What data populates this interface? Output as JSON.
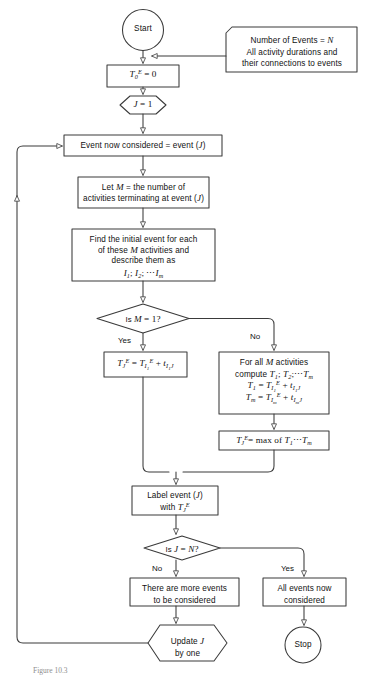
{
  "figure": {
    "caption": "Figure 10.3",
    "background_color": "#ffffff",
    "line_color": "#3a3a3a",
    "text_color": "#111111"
  },
  "nodes": {
    "start": {
      "label": "Start",
      "shape": "circle"
    },
    "input_annotation": {
      "shape": "input-data",
      "lines": [
        "Number of Events = N",
        "All activity durations and",
        "their connections to events"
      ]
    },
    "init_t0": {
      "shape": "process",
      "label": "T0E = 0",
      "text": "T",
      "sub": "0",
      "sup": "E",
      "rhs": "= 0"
    },
    "init_j": {
      "shape": "hexagon",
      "label": "J = 1"
    },
    "event_considered": {
      "shape": "process",
      "label": "Event now considered = event (J)"
    },
    "let_m": {
      "shape": "process",
      "lines": [
        "Let M = the number of",
        "activities terminating at event (J)"
      ]
    },
    "find_initial": {
      "shape": "process",
      "lines": [
        "Find the initial event for each",
        "of these M activities and",
        "describe them as",
        "I1; I2; ... Im"
      ]
    },
    "decision_m": {
      "shape": "diamond",
      "label": "Is M = 1?",
      "yes": "Yes",
      "no": "No"
    },
    "single_formula": {
      "shape": "process",
      "label": "TJE = TI1E + tI1J"
    },
    "multi_compute": {
      "shape": "process",
      "lines": [
        "For all M activities",
        "compute T1; T2; ... Tm",
        "T1 = TI1E + tI1J",
        "Tm = TImE + tImJ"
      ]
    },
    "max_formula": {
      "shape": "process",
      "label": "TJE = max of T1 ... Tm"
    },
    "label_event": {
      "shape": "process",
      "lines": [
        "Label event (J)",
        "with TJE"
      ]
    },
    "decision_j": {
      "shape": "diamond",
      "label": "Is J = N?",
      "yes": "Yes",
      "no": "No"
    },
    "more_events": {
      "shape": "process",
      "lines": [
        "There are more events",
        "to be considered"
      ]
    },
    "all_done": {
      "shape": "process",
      "lines": [
        "All events now",
        "considered"
      ]
    },
    "update_j": {
      "shape": "hexagon",
      "lines": [
        "Update J",
        "by one"
      ]
    },
    "stop": {
      "label": "Stop",
      "shape": "circle"
    }
  },
  "edges": [
    {
      "from": "start",
      "to": "init_t0",
      "label": ""
    },
    {
      "from": "input_annotation",
      "to": "init_t0",
      "label": ""
    },
    {
      "from": "init_t0",
      "to": "init_j",
      "label": ""
    },
    {
      "from": "init_j",
      "to": "event_considered",
      "label": ""
    },
    {
      "from": "event_considered",
      "to": "let_m",
      "label": ""
    },
    {
      "from": "let_m",
      "to": "find_initial",
      "label": ""
    },
    {
      "from": "find_initial",
      "to": "decision_m",
      "label": ""
    },
    {
      "from": "decision_m",
      "to": "single_formula",
      "label": "Yes"
    },
    {
      "from": "decision_m",
      "to": "multi_compute",
      "label": "No"
    },
    {
      "from": "multi_compute",
      "to": "max_formula",
      "label": ""
    },
    {
      "from": "single_formula",
      "to": "label_event",
      "label": ""
    },
    {
      "from": "max_formula",
      "to": "label_event",
      "label": ""
    },
    {
      "from": "label_event",
      "to": "decision_j",
      "label": ""
    },
    {
      "from": "decision_j",
      "to": "more_events",
      "label": "No"
    },
    {
      "from": "decision_j",
      "to": "all_done",
      "label": "Yes"
    },
    {
      "from": "more_events",
      "to": "update_j",
      "label": ""
    },
    {
      "from": "all_done",
      "to": "stop",
      "label": ""
    },
    {
      "from": "update_j",
      "to": "event_considered",
      "label": ""
    }
  ]
}
